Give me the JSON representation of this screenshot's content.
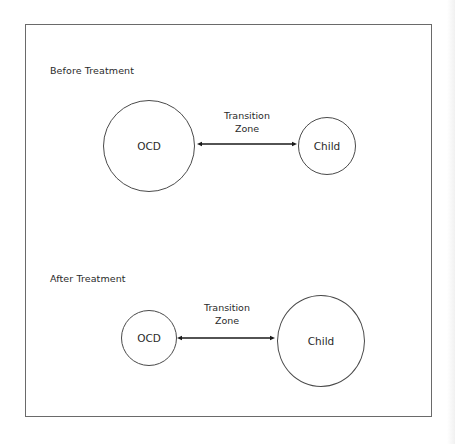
{
  "diagram": {
    "before": {
      "title": "Before Treatment",
      "left_node": "OCD",
      "right_node": "Child",
      "connector_label_line1": "Transition",
      "connector_label_line2": "Zone",
      "left_radius": 46,
      "right_radius": 29
    },
    "after": {
      "title": "After Treatment",
      "left_node": "OCD",
      "right_node": "Child",
      "connector_label_line1": "Transition",
      "connector_label_line2": "Zone",
      "left_radius": 28,
      "right_radius": 44
    },
    "colors": {
      "stroke": "#4a4a4a",
      "arrow": "#1a1a1a",
      "text": "#2a2a2a",
      "frame": "#6a6a6a"
    }
  }
}
